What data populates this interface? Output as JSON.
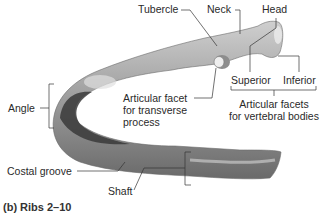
{
  "figure": {
    "caption": "(b) Ribs 2–10",
    "colors": {
      "bone_light": "#d8d8d8",
      "bone_mid": "#9a9a9a",
      "bone_dark": "#3a3a3a",
      "leader_line": "#333333"
    },
    "labels": {
      "tubercle": "Tubercle",
      "neck": "Neck",
      "head": "Head",
      "superior": "Superior",
      "inferior": "Inferior",
      "articular_facets_line1": "Articular facets",
      "articular_facets_line2": "for vertebral bodies",
      "articular_facet_line1": "Articular facet",
      "articular_facet_line2": "for transverse",
      "articular_facet_line3": "process",
      "angle": "Angle",
      "costal_groove": "Costal groove",
      "shaft": "Shaft"
    }
  }
}
